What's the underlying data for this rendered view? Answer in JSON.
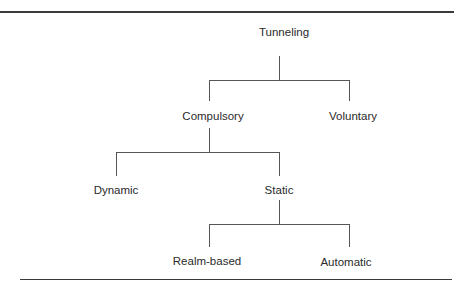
{
  "diagram": {
    "nodes": {
      "root": "Tunneling",
      "compulsory": "Compulsory",
      "voluntary": "Voluntary",
      "dynamic": "Dynamic",
      "static": "Static",
      "realm_based": "Realm-based",
      "automatic": "Automatic"
    },
    "edges": [
      [
        "Tunneling",
        "Compulsory"
      ],
      [
        "Tunneling",
        "Voluntary"
      ],
      [
        "Compulsory",
        "Dynamic"
      ],
      [
        "Compulsory",
        "Static"
      ],
      [
        "Static",
        "Realm-based"
      ],
      [
        "Static",
        "Automatic"
      ]
    ]
  }
}
